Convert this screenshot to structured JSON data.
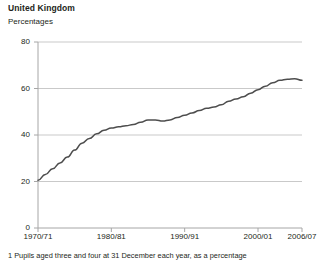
{
  "header": {
    "title": "United Kingdom",
    "subtitle": "Percentages"
  },
  "footnote": {
    "text": "1  Pupils aged three and four at 31 December each year, as a percentage"
  },
  "chart_data": {
    "type": "line",
    "title": "United Kingdom",
    "subtitle": "Percentages",
    "xlabel": "",
    "ylabel": "Percentages",
    "ylim": [
      0,
      80
    ],
    "yticks": [
      0,
      20,
      40,
      60,
      80
    ],
    "ytick_labels": [
      "0",
      "20",
      "40",
      "60",
      "80"
    ],
    "xlim": [
      1970,
      2006
    ],
    "xticks": [
      1970,
      1980,
      1990,
      2000,
      2006
    ],
    "xtick_labels": [
      "1970/71",
      "1980/81",
      "1990/91",
      "2000/01",
      "2006/07"
    ],
    "grid": "horizontal",
    "legend": "none",
    "line_color": "#4d4d4d",
    "gridline_color": "#c9c9c9",
    "axis_color": "#a6a6a6",
    "series": [
      {
        "name": "Children under five in schools",
        "x": [
          1970,
          1971,
          1972,
          1973,
          1974,
          1975,
          1976,
          1977,
          1978,
          1979,
          1980,
          1981,
          1982,
          1983,
          1984,
          1985,
          1986,
          1987,
          1988,
          1989,
          1990,
          1991,
          1992,
          1993,
          1994,
          1995,
          1996,
          1997,
          1998,
          1999,
          2000,
          2001,
          2002,
          2003,
          2004,
          2005,
          2006
        ],
        "values": [
          20.5,
          23.0,
          25.5,
          28.0,
          30.5,
          33.5,
          36.5,
          38.5,
          40.5,
          42.0,
          43.0,
          43.5,
          44.0,
          44.5,
          45.5,
          46.5,
          46.5,
          46.0,
          46.5,
          47.5,
          48.5,
          49.5,
          50.5,
          51.5,
          52.0,
          53.0,
          54.5,
          55.5,
          56.5,
          58.0,
          59.5,
          61.0,
          62.5,
          63.5,
          64.0,
          64.2,
          63.5
        ]
      }
    ]
  },
  "axes": {
    "y_label_positions": [
      228,
      181,
      135,
      88,
      42
    ],
    "x_label_positions": [
      38,
      103,
      174,
      245,
      288
    ]
  }
}
